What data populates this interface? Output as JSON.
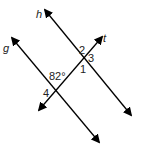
{
  "diagram": {
    "type": "parallel-lines-transversal",
    "lines": [
      {
        "name": "h",
        "label": "h"
      },
      {
        "name": "g",
        "label": "g"
      },
      {
        "name": "t",
        "label": "t"
      }
    ],
    "angle_labels": {
      "a1": "1",
      "a2": "2",
      "a3": "3",
      "a4": "4",
      "given": "82°"
    },
    "color": "#000000"
  }
}
